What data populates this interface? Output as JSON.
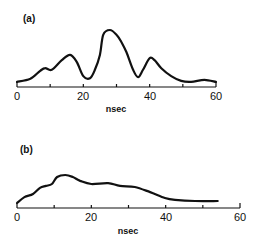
{
  "chart_data": [
    {
      "type": "line",
      "panel_label": "(a)",
      "xlabel": "nsec",
      "ylabel": "",
      "xlim": [
        0,
        60
      ],
      "xticks": [
        0,
        10,
        20,
        30,
        40,
        50,
        60
      ],
      "xtick_labels": [
        "0",
        "20",
        "40",
        "60"
      ],
      "grid": false,
      "legend": null,
      "series": [
        {
          "name": "a",
          "x": [
            0,
            4,
            7,
            8.5,
            10.5,
            13.5,
            16,
            18,
            20,
            22,
            23.5,
            25,
            26,
            28,
            30,
            31.5,
            33,
            35,
            36.5,
            38,
            40,
            41.5,
            43.5,
            46.5,
            49.5,
            52.5,
            56.5,
            60
          ],
          "y": [
            0.02,
            0.08,
            0.23,
            0.28,
            0.25,
            0.43,
            0.53,
            0.4,
            0.13,
            0.09,
            0.25,
            0.53,
            0.91,
            1.0,
            0.91,
            0.77,
            0.58,
            0.25,
            0.11,
            0.25,
            0.47,
            0.43,
            0.28,
            0.13,
            0.04,
            0.02,
            0.06,
            0.02
          ]
        }
      ]
    },
    {
      "type": "line",
      "panel_label": "(b)",
      "xlabel": "nsec",
      "ylabel": "",
      "xlim": [
        0,
        60
      ],
      "xticks": [
        0,
        10,
        20,
        30,
        40,
        50,
        60
      ],
      "xtick_labels": [
        "0",
        "20",
        "40",
        "60"
      ],
      "grid": false,
      "legend": null,
      "series": [
        {
          "name": "b",
          "x": [
            0,
            2,
            4.3,
            6.2,
            7.8,
            9.4,
            10.8,
            13,
            15,
            17,
            20,
            24.5,
            27.7,
            31.7,
            35.8,
            39.8,
            42.5,
            47.9,
            54
          ],
          "y": [
            0.0,
            0.21,
            0.32,
            0.54,
            0.61,
            0.68,
            0.93,
            1.0,
            0.93,
            0.79,
            0.68,
            0.71,
            0.61,
            0.57,
            0.39,
            0.18,
            0.11,
            0.07,
            0.07
          ]
        }
      ]
    }
  ],
  "panels": [
    {
      "label": "(a)",
      "xlabel": "nsec",
      "ticks": [
        "0",
        "20",
        "40",
        "60"
      ]
    },
    {
      "label": "(b)",
      "xlabel": "nsec",
      "ticks": [
        "0",
        "20",
        "40",
        "60"
      ]
    }
  ]
}
